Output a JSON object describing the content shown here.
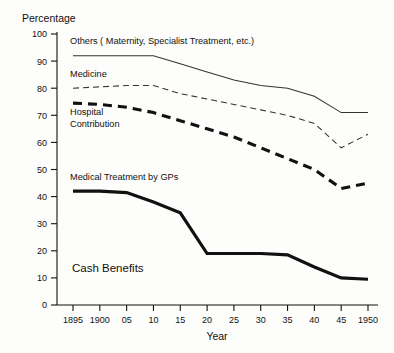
{
  "chart_data": {
    "type": "line",
    "title": "",
    "ylabel": "Percentage",
    "xlabel": "Year",
    "ylim": [
      0,
      100
    ],
    "ytick_values": [
      0,
      10,
      20,
      30,
      40,
      50,
      60,
      70,
      80,
      90,
      100
    ],
    "ytick_labels": [
      "0",
      "10",
      "20",
      "30",
      "40",
      "50",
      "60",
      "70",
      "80",
      "90",
      "100"
    ],
    "x": [
      1895,
      1900,
      1905,
      1910,
      1915,
      1920,
      1925,
      1930,
      1935,
      1940,
      1945,
      1950
    ],
    "xtick_labels": [
      "1895",
      "1900",
      "05",
      "10",
      "15",
      "20",
      "25",
      "30",
      "35",
      "40",
      "45",
      "1950"
    ],
    "grid": false,
    "legend_position": "inline-annotations",
    "series": [
      {
        "name": "Others ( Maternity, Specialist Treatment, etc.)",
        "style": "thin-solid",
        "values": [
          92,
          92,
          92,
          92,
          89,
          86,
          83,
          81,
          80,
          77,
          71,
          71
        ]
      },
      {
        "name": "Medicine",
        "style": "thin-dashed",
        "values": [
          80,
          80.5,
          81,
          81,
          78,
          76,
          74,
          72,
          70,
          67,
          58,
          63
        ]
      },
      {
        "name": "Hospital Contribution",
        "style": "thick-dashed",
        "values": [
          74.5,
          74,
          73,
          71,
          68,
          65,
          62,
          58,
          54,
          50,
          43,
          45
        ]
      },
      {
        "name": "Medical Treatment by GPs",
        "style": "thick-solid",
        "values": [
          42,
          42,
          41.5,
          38,
          34,
          19,
          19,
          19,
          18.5,
          14,
          10,
          9.5
        ]
      }
    ],
    "annotations": [
      {
        "text": "Others ( Maternity, Specialist Treatment, etc.)",
        "x": 1896,
        "y": 97
      },
      {
        "text": "Medicine",
        "x": 1896,
        "y": 85
      },
      {
        "text": "Hospital",
        "x": 1896,
        "y": 71
      },
      {
        "text": "Contribution",
        "x": 1896,
        "y": 66
      },
      {
        "text": "Medical Treatment by GPs",
        "x": 1896,
        "y": 47
      },
      {
        "text": "Cash Benefits",
        "x": 1897,
        "y": 12
      }
    ]
  },
  "labels": {
    "y_axis_title": "Percentage",
    "x_axis_title": "Year",
    "others": "Others ( Maternity, Specialist Treatment, etc.)",
    "medicine": "Medicine",
    "hospital_line1": "Hospital",
    "hospital_line2": "Contribution",
    "gps": "Medical Treatment by GPs",
    "cash_benefits": "Cash Benefits"
  },
  "colors": {
    "ink": "#111111",
    "thin_line": "#333333",
    "background": "#fdfdfb"
  }
}
